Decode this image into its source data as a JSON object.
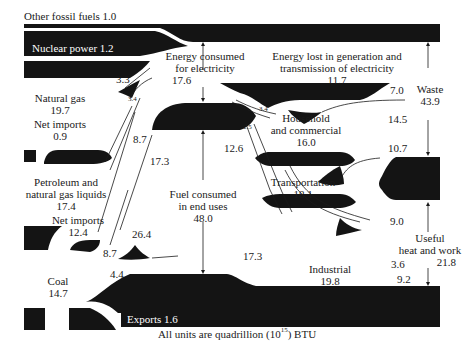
{
  "diagram": {
    "caption_prefix": "All units are quadrillion (10",
    "caption_exp": "15",
    "caption_suffix": ") BTU",
    "colors": {
      "flow": "#141414",
      "background": "#ffffff",
      "text": "#1a1a1a",
      "inverse_text": "#ffffff"
    },
    "sources": [
      {
        "id": "other-fossil",
        "label": "Other fossil fuels 1.0",
        "value": 1.0
      },
      {
        "id": "nuclear",
        "label": "Nuclear power 1.2",
        "value": 1.2
      },
      {
        "id": "natural-gas",
        "label": "Natural gas",
        "value_text": "19.7",
        "value": 19.7
      },
      {
        "id": "gas-net-imports",
        "label": "Net imports",
        "value_text": "0.9",
        "value": 0.9
      },
      {
        "id": "petroleum",
        "label_line1": "Petroleum and",
        "label_line2": "natural gas liquids",
        "value_text": "17.4",
        "value": 17.4
      },
      {
        "id": "petroleum-net-imports",
        "label": "Net imports",
        "value_text": "12.4",
        "value": 12.4
      },
      {
        "id": "coal",
        "label": "Coal",
        "value_text": "14.7",
        "value": 14.7
      }
    ],
    "sinks": [
      {
        "id": "exports",
        "label": "Exports 1.6",
        "value": 1.6
      }
    ],
    "nodes": {
      "electricity": {
        "line1": "Energy consumed",
        "line2": "for electricity",
        "value_text": "17.6",
        "value": 17.6
      },
      "losses": {
        "line1": "Energy lost in generation and",
        "line2": "transmission of electricity",
        "value_text": "11.7",
        "value": 11.7
      },
      "end_uses": {
        "line1": "Fuel consumed",
        "line2": "in end uses",
        "value_text": "48.0",
        "value": 48.0
      },
      "household": {
        "line1": "Household",
        "line2": "and commercial",
        "value_text": "16.0",
        "value": 16.0
      },
      "transportation": {
        "line1": "Transportation",
        "value_text": "18.1",
        "value": 18.1
      },
      "industrial": {
        "line1": "Industrial",
        "value_text": "19.8",
        "value": 19.8
      },
      "waste": {
        "line1": "Waste",
        "value_text": "43.9",
        "value": 43.9
      },
      "useful": {
        "line1": "Useful",
        "line2": "heat and work",
        "value_text": "21.8",
        "value": 21.8
      }
    },
    "flow_labels": {
      "gas_to_electricity": "3.3",
      "petroleum_to_electricity": "3.4",
      "gas_to_end_uses": "8.7",
      "petroleum_to_end_uses_a": "17.3",
      "coal_to_electricity": "8.7",
      "coal_petroleum_mix": "26.4",
      "coal_to_end_uses": "4.4",
      "electricity_to_household": "3.4",
      "electricity_to_transport_industrial": "2.5",
      "electricity_to_end_uses": "12.6",
      "end_uses_to_industrial": "17.3",
      "household_waste": "7.0",
      "transport_waste": "14.5",
      "industrial_waste": "10.7",
      "household_useful": "9.0",
      "transport_useful": "3.6",
      "industrial_useful": "9.2"
    }
  }
}
